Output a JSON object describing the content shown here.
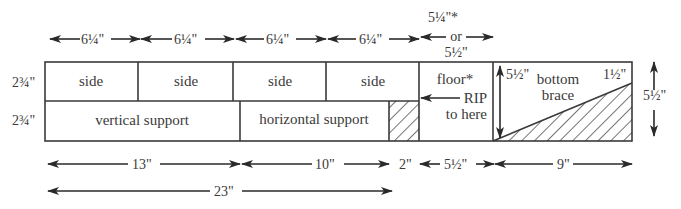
{
  "diagram": {
    "pieces": {
      "side_1": "side",
      "side_2": "side",
      "side_3": "side",
      "side_4": "side",
      "floor": "floor*",
      "rip_line1": "RIP",
      "rip_line2": "to here",
      "vertical_support": "vertical support",
      "horizontal_support": "horizontal support",
      "bottom_brace_line1": "bottom",
      "bottom_brace_line2": "brace"
    },
    "row_heights": {
      "top_row": "2¾\"",
      "bottom_row": "2¾\""
    },
    "top_dimensions": {
      "side_1": "6¼\"",
      "side_2": "6¼\"",
      "side_3": "6¼\"",
      "side_4": "6¼\"",
      "floor_line1": "5¼\"*",
      "floor_line2": "or",
      "floor_line3": "5½\""
    },
    "brace_dimensions": {
      "left_height": "5½\"",
      "right_corner": "1½\"",
      "overall_height": "5½\""
    },
    "bottom_dimensions": {
      "vertical_support": "13\"",
      "horizontal_support": "10\"",
      "hatched_waste": "2\"",
      "floor": "5½\"",
      "bottom_brace": "9\"",
      "total_supports": "23\""
    }
  }
}
